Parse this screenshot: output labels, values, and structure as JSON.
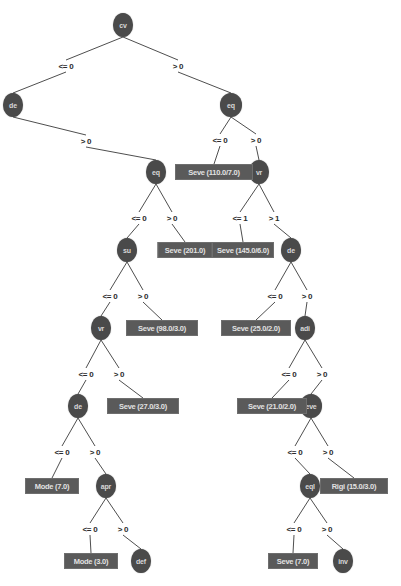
{
  "diagram": {
    "type": "decision-tree",
    "colors": {
      "node_fill": "#4a4a4a",
      "node_text": "#d8d8d8",
      "leaf_fill": "#5a5a5a",
      "leaf_text": "#e2e2e2",
      "edge": "#3a3a3a",
      "background": "#ffffff"
    },
    "nodes": [
      {
        "id": "n_cv",
        "label": "cv",
        "x": 123,
        "y": 25,
        "rx": 10,
        "ry": 12
      },
      {
        "id": "n_de",
        "label": "de",
        "x": 13,
        "y": 105,
        "rx": 10,
        "ry": 12
      },
      {
        "id": "n_eq1",
        "label": "eq",
        "x": 231,
        "y": 105,
        "rx": 11,
        "ry": 12
      },
      {
        "id": "n_eq2",
        "label": "eq",
        "x": 156,
        "y": 172,
        "rx": 10,
        "ry": 12
      },
      {
        "id": "n_vr1",
        "label": "vr",
        "x": 259,
        "y": 172,
        "rx": 10,
        "ry": 12
      },
      {
        "id": "n_su",
        "label": "su",
        "x": 127,
        "y": 250,
        "rx": 10,
        "ry": 12
      },
      {
        "id": "n_de2",
        "label": "de",
        "x": 291,
        "y": 250,
        "rx": 10,
        "ry": 12
      },
      {
        "id": "n_vr2",
        "label": "vr",
        "x": 101,
        "y": 328,
        "rx": 10,
        "ry": 12
      },
      {
        "id": "n_adi",
        "label": "adi",
        "x": 305,
        "y": 328,
        "rx": 10,
        "ry": 12
      },
      {
        "id": "n_de3",
        "label": "de",
        "x": 78,
        "y": 406,
        "rx": 10,
        "ry": 12
      },
      {
        "id": "n_eve",
        "label": "eve",
        "x": 311,
        "y": 406,
        "rx": 11,
        "ry": 12
      },
      {
        "id": "n_apr",
        "label": "apr",
        "x": 106,
        "y": 486,
        "rx": 10,
        "ry": 12
      },
      {
        "id": "n_eql",
        "label": "eql",
        "x": 310,
        "y": 486,
        "rx": 10,
        "ry": 12
      },
      {
        "id": "n_def",
        "label": "def",
        "x": 141,
        "y": 561,
        "rx": 10,
        "ry": 12
      },
      {
        "id": "n_inv",
        "label": "inv",
        "x": 343,
        "y": 561,
        "rx": 10,
        "ry": 12
      }
    ],
    "leaves": [
      {
        "id": "l_110",
        "label": "Seve (110.0/7.0)",
        "x": 214,
        "y": 172,
        "w": 78,
        "h": 16
      },
      {
        "id": "l_201",
        "label": "Seve (201.0)",
        "x": 185,
        "y": 250,
        "w": 55,
        "h": 16
      },
      {
        "id": "l_145",
        "label": "Seve (145.0/6.0)",
        "x": 243,
        "y": 250,
        "w": 62,
        "h": 16
      },
      {
        "id": "l_98",
        "label": "Seve (98.0/3.0)",
        "x": 162,
        "y": 328,
        "w": 72,
        "h": 16
      },
      {
        "id": "l_25",
        "label": "Seve (25.0/2.0)",
        "x": 256,
        "y": 328,
        "w": 70,
        "h": 16
      },
      {
        "id": "l_27",
        "label": "Seve (27.0/3.0)",
        "x": 143,
        "y": 406,
        "w": 72,
        "h": 16
      },
      {
        "id": "l_21",
        "label": "Seve (21.0/2.0)",
        "x": 272,
        "y": 406,
        "w": 70,
        "h": 16
      },
      {
        "id": "l_m7",
        "label": "Mode (7.0)",
        "x": 52,
        "y": 486,
        "w": 54,
        "h": 16
      },
      {
        "id": "l_rigi",
        "label": "Rigi (15.0/3.0)",
        "x": 354,
        "y": 486,
        "w": 68,
        "h": 16
      },
      {
        "id": "l_m3",
        "label": "Mode (3.0)",
        "x": 91,
        "y": 561,
        "w": 54,
        "h": 16
      },
      {
        "id": "l_s7",
        "label": "Seve (7.0)",
        "x": 293,
        "y": 561,
        "w": 50,
        "h": 16
      }
    ],
    "edges": [
      {
        "from": "n_cv",
        "to": "n_de",
        "label": "<= 0",
        "lx": 66,
        "ly": 66
      },
      {
        "from": "n_cv",
        "to": "n_eq1",
        "label": "> 0",
        "lx": 178,
        "ly": 66
      },
      {
        "from": "n_de",
        "to": "n_eq2",
        "label": "> 0",
        "lx": 86,
        "ly": 141
      },
      {
        "from": "n_eq1",
        "to": "l_110",
        "label": "<= 0",
        "lx": 220,
        "ly": 140
      },
      {
        "from": "n_eq1",
        "to": "n_vr1",
        "label": "> 0",
        "lx": 256,
        "ly": 140
      },
      {
        "from": "n_eq2",
        "to": "n_su",
        "label": "<= 0",
        "lx": 139,
        "ly": 218
      },
      {
        "from": "n_eq2",
        "to": "l_201",
        "label": "> 0",
        "lx": 172,
        "ly": 218
      },
      {
        "from": "n_vr1",
        "to": "l_145",
        "label": "<= 1",
        "lx": 240,
        "ly": 218
      },
      {
        "from": "n_vr1",
        "to": "n_de2",
        "label": "> 1",
        "lx": 274,
        "ly": 218
      },
      {
        "from": "n_su",
        "to": "n_vr2",
        "label": "<= 0",
        "lx": 110,
        "ly": 296
      },
      {
        "from": "n_su",
        "to": "l_98",
        "label": "> 0",
        "lx": 143,
        "ly": 296
      },
      {
        "from": "n_de2",
        "to": "l_25",
        "label": "<= 0",
        "lx": 275,
        "ly": 296
      },
      {
        "from": "n_de2",
        "to": "n_adi",
        "label": "> 0",
        "lx": 307,
        "ly": 296
      },
      {
        "from": "n_vr2",
        "to": "n_de3",
        "label": "<= 0",
        "lx": 86,
        "ly": 374
      },
      {
        "from": "n_vr2",
        "to": "l_27",
        "label": "> 0",
        "lx": 119,
        "ly": 374
      },
      {
        "from": "n_adi",
        "to": "l_21",
        "label": "<= 0",
        "lx": 289,
        "ly": 374
      },
      {
        "from": "n_adi",
        "to": "n_eve",
        "label": "> 0",
        "lx": 322,
        "ly": 374
      },
      {
        "from": "n_de3",
        "to": "l_m7",
        "label": "<= 0",
        "lx": 62,
        "ly": 452
      },
      {
        "from": "n_de3",
        "to": "n_apr",
        "label": "> 0",
        "lx": 95,
        "ly": 452
      },
      {
        "from": "n_eve",
        "to": "n_eql",
        "label": "<= 0",
        "lx": 295,
        "ly": 452
      },
      {
        "from": "n_eve",
        "to": "l_rigi",
        "label": "> 0",
        "lx": 328,
        "ly": 452
      },
      {
        "from": "n_apr",
        "to": "l_m3",
        "label": "<= 0",
        "lx": 90,
        "ly": 529
      },
      {
        "from": "n_apr",
        "to": "n_def",
        "label": "> 0",
        "lx": 123,
        "ly": 529
      },
      {
        "from": "n_eql",
        "to": "l_s7",
        "label": "<= 0",
        "lx": 294,
        "ly": 529
      },
      {
        "from": "n_eql",
        "to": "n_inv",
        "label": "> 0",
        "lx": 327,
        "ly": 529
      }
    ]
  }
}
